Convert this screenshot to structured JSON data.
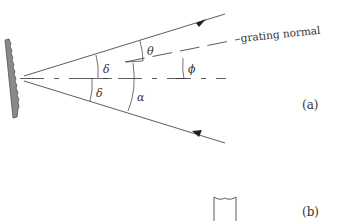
{
  "figure": {
    "panel_a": {
      "label": "(a)",
      "normal_label": "grating normal",
      "angles": {
        "delta_upper": "δ",
        "delta_lower": "δ",
        "theta": "θ",
        "alpha": "α",
        "phi": "ϕ"
      }
    },
    "panel_b": {
      "label": "(b)"
    },
    "colors": {
      "line": "#333333",
      "grating_fill": "#8a8a8a",
      "background": "#ffffff"
    }
  }
}
